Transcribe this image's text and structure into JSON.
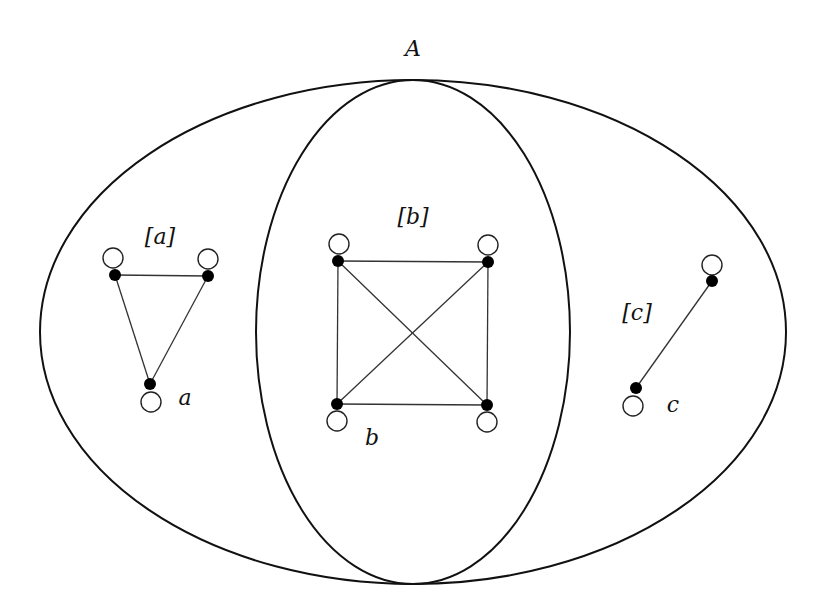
{
  "diagram": {
    "title_label": "A",
    "outer_ellipse": {
      "cx": 413,
      "cy": 332,
      "rx": 373,
      "ry": 252
    },
    "inner_ellipse": {
      "cx": 413,
      "cy": 332,
      "rx": 157,
      "ry": 252
    },
    "classes": [
      {
        "id": "a",
        "class_label": "[a]",
        "element_label": "a",
        "class_label_pos": [
          160,
          244
        ],
        "element_label_pos": [
          185,
          405
        ],
        "nodes": [
          [
            115,
            275
          ],
          [
            208,
            276
          ],
          [
            150,
            384
          ]
        ],
        "loops": [
          [
            113,
            258
          ],
          [
            208,
            259
          ],
          [
            151,
            402
          ]
        ],
        "edges": [
          [
            0,
            1
          ],
          [
            0,
            2
          ],
          [
            1,
            2
          ]
        ]
      },
      {
        "id": "b",
        "class_label": "[b]",
        "element_label": "b",
        "class_label_pos": [
          413,
          224
        ],
        "element_label_pos": [
          372,
          445
        ],
        "nodes": [
          [
            338,
            261
          ],
          [
            488,
            262
          ],
          [
            337,
            404
          ],
          [
            487,
            405
          ]
        ],
        "loops": [
          [
            339,
            244
          ],
          [
            488,
            245
          ],
          [
            337,
            421
          ],
          [
            487,
            422
          ]
        ],
        "edges": [
          [
            0,
            1
          ],
          [
            0,
            2
          ],
          [
            0,
            3
          ],
          [
            1,
            2
          ],
          [
            1,
            3
          ],
          [
            2,
            3
          ]
        ]
      },
      {
        "id": "c",
        "class_label": "[c]",
        "element_label": "c",
        "class_label_pos": [
          637,
          320
        ],
        "element_label_pos": [
          673,
          412
        ],
        "nodes": [
          [
            712,
            281
          ],
          [
            636,
            388
          ]
        ],
        "loops": [
          [
            712,
            265
          ],
          [
            633,
            406
          ]
        ],
        "edges": [
          [
            0,
            1
          ]
        ]
      }
    ]
  }
}
